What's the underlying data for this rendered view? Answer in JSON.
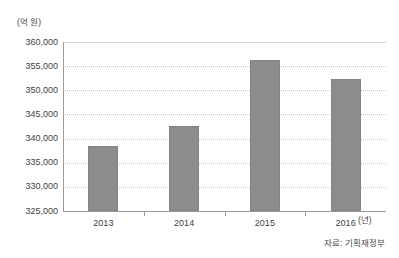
{
  "chart_data": {
    "type": "bar",
    "title": "",
    "categories": [
      "2013",
      "2014",
      "2015",
      "2016"
    ],
    "values": [
      338500,
      342700,
      356200,
      352300
    ],
    "series": [
      {
        "name": "",
        "values": [
          338500,
          342700,
          356200,
          352300
        ]
      }
    ],
    "xlabel": "(년)",
    "ylabel": "(억 원)",
    "ylim": [
      325000,
      360000
    ],
    "ytick_labels": [
      "360,000",
      "355,000",
      "350,000",
      "345,000",
      "340,000",
      "335,000",
      "330,000",
      "325,000"
    ],
    "ytick_values": [
      360000,
      355000,
      350000,
      345000,
      340000,
      335000,
      330000,
      325000
    ],
    "grid": true,
    "legend": null,
    "bar_color": "#8c8c8c",
    "gridline_color": "#c8c8c8",
    "axis_color": "#9a9a9a",
    "source_note": "자료: 기획재정부"
  }
}
